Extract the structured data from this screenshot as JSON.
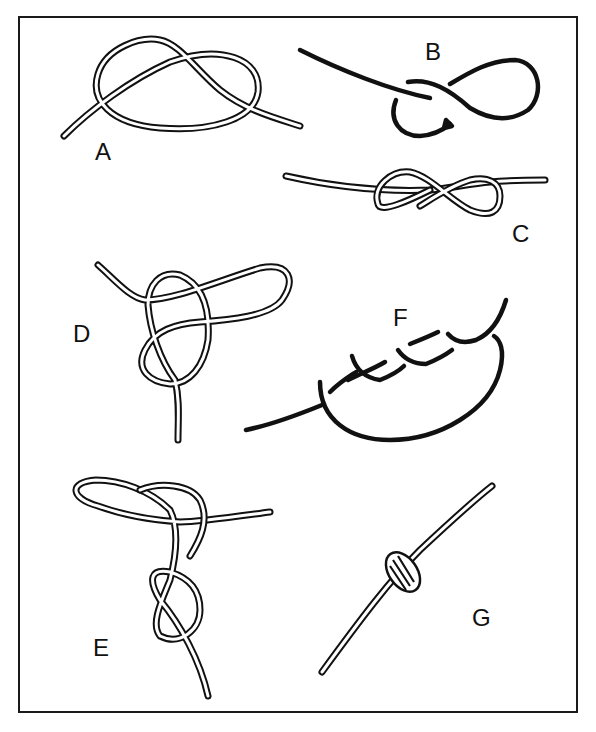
{
  "figure": {
    "panels": [
      {
        "id": "A",
        "label": "A"
      },
      {
        "id": "B",
        "label": "B"
      },
      {
        "id": "C",
        "label": "C"
      },
      {
        "id": "D",
        "label": "D"
      },
      {
        "id": "E",
        "label": "E"
      },
      {
        "id": "F",
        "label": "F"
      },
      {
        "id": "G",
        "label": "G"
      }
    ]
  },
  "colors": {
    "line": "#111111",
    "background": "#ffffff"
  }
}
